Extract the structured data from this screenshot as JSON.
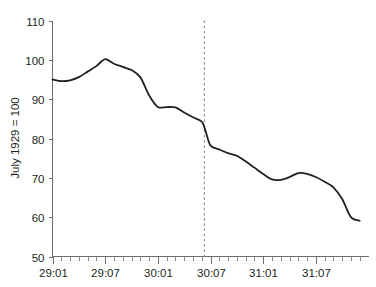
{
  "chart_data": {
    "type": "line",
    "title": "",
    "subtitle": "",
    "xlabel": "",
    "ylabel": "July 1929 = 100",
    "ylim": [
      50,
      110
    ],
    "xlim": [
      0,
      36
    ],
    "grid": false,
    "legend": null,
    "y_ticks": [
      50,
      60,
      70,
      80,
      90,
      100,
      110
    ],
    "y_tick_labels": [
      "50",
      "60",
      "70",
      "80",
      "90",
      "100",
      "110"
    ],
    "x_tick_labels": [
      "29:01",
      "29:07",
      "30:01",
      "30:07",
      "31:01",
      "31:07"
    ],
    "x_tick_positions": [
      0,
      6,
      12,
      18,
      24,
      30
    ],
    "x_minor_tick_step_months": 1,
    "annotations": [
      {
        "name": "vertical-dashed-marker",
        "kind": "vline",
        "x": 17.3,
        "label": "",
        "style": "dashed",
        "color": "#8a8a8c"
      }
    ],
    "series": [
      {
        "name": "Industrial production index",
        "color": "#231f20",
        "x": [
          0,
          1,
          2,
          3,
          4,
          5,
          6,
          7,
          8,
          9,
          10,
          11,
          12,
          13,
          14,
          15,
          16,
          17,
          17.4,
          18,
          19,
          20,
          21,
          22,
          23,
          24,
          25,
          26,
          27,
          28,
          29,
          30,
          31,
          32,
          33,
          34,
          35
        ],
        "values": [
          95.0,
          94.6,
          94.8,
          95.6,
          97.0,
          98.4,
          100.2,
          99.0,
          98.2,
          97.4,
          95.6,
          91.0,
          88.0,
          88.0,
          87.9,
          86.6,
          85.4,
          84.3,
          82.2,
          78.2,
          77.2,
          76.3,
          75.6,
          74.2,
          72.6,
          71.0,
          69.6,
          69.5,
          70.2,
          71.2,
          71.0,
          70.2,
          69.0,
          67.6,
          64.6,
          60.0,
          59.1
        ]
      }
    ]
  },
  "axis": {
    "y_label": "July 1929 = 100"
  }
}
